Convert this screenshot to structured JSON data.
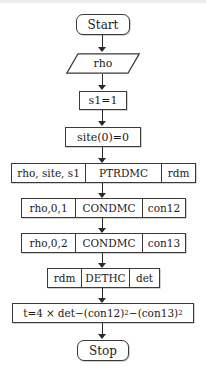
{
  "diagram": {
    "orientation": "top-to-bottom",
    "accent_color": "#3a3a3a",
    "background_color": "#ffffff"
  },
  "nodes": {
    "start": {
      "label": "Start",
      "shape": "terminator"
    },
    "input_rho": {
      "label": "rho",
      "shape": "parallelogram-io"
    },
    "set_s1": {
      "label": "s1=1",
      "shape": "process"
    },
    "set_site": {
      "label": "site(0)=0",
      "shape": "process"
    },
    "ptrdmc": {
      "shape": "subroutine-row",
      "input": "rho, site, s1",
      "procedure": "PTRDMC",
      "output": "rdm"
    },
    "condmc_12": {
      "shape": "subroutine-row",
      "input": "rho,0,1",
      "procedure": "CONDMC",
      "output": "con12"
    },
    "condmc_13": {
      "shape": "subroutine-row",
      "input": "rho,0,2",
      "procedure": "CONDMC",
      "output": "con13"
    },
    "dethc": {
      "shape": "subroutine-row",
      "input": "rdm",
      "procedure": "DETHC",
      "output": "det"
    },
    "formula": {
      "shape": "process",
      "lhs": "t=4",
      "times": "×",
      "term1": "det",
      "minus1": "−(",
      "var1": "con12",
      "close1": ")",
      "exp1": "2",
      "minus2": "−(",
      "var2": "con13",
      "close2": ")",
      "exp2": "2"
    },
    "stop": {
      "label": "Stop",
      "shape": "terminator"
    }
  },
  "edges": [
    {
      "from": "start",
      "to": "input_rho"
    },
    {
      "from": "input_rho",
      "to": "set_s1"
    },
    {
      "from": "set_s1",
      "to": "set_site"
    },
    {
      "from": "set_site",
      "to": "ptrdmc"
    },
    {
      "from": "ptrdmc",
      "to": "condmc_12"
    },
    {
      "from": "condmc_12",
      "to": "condmc_13"
    },
    {
      "from": "condmc_13",
      "to": "dethc"
    },
    {
      "from": "dethc",
      "to": "formula"
    },
    {
      "from": "formula",
      "to": "stop"
    }
  ]
}
